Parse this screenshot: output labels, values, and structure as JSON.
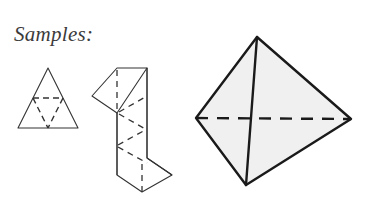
{
  "caption": {
    "text": "Samples:",
    "color": "#3b3b3b"
  },
  "canvas": {
    "width": 372,
    "height": 198,
    "background": "#ffffff"
  },
  "style": {
    "stroke_color": "#333333",
    "solid_stroke_width": 1.1,
    "heavy_stroke_width": 2.2,
    "dashed_stroke_width": 1.3,
    "dash_pattern_small": "5,4",
    "dash_pattern_large": "11,8",
    "solid_fill": "#f0f0f0"
  },
  "figures": [
    {
      "id": "triangle-net",
      "name": "triangular net with midpoint fold lines",
      "fill": "none",
      "outline": [
        [
          18,
          128
        ],
        [
          48,
          68
        ],
        [
          78,
          128
        ]
      ],
      "fold_lines": [
        [
          [
            33,
            98
          ],
          [
            63,
            98
          ]
        ],
        [
          [
            33,
            98
          ],
          [
            48,
            128
          ]
        ],
        [
          [
            63,
            98
          ],
          [
            48,
            128
          ]
        ]
      ]
    },
    {
      "id": "strip-net",
      "name": "zigzag parallelogram strip net",
      "fill": "none",
      "outline": [
        [
          117,
          68
        ],
        [
          142,
          85
        ],
        [
          142,
          175
        ],
        [
          172,
          175
        ],
        [
          147,
          158
        ],
        [
          147,
          68
        ],
        [
          92,
          96
        ],
        [
          117,
          113
        ],
        [
          117,
          68
        ]
      ],
      "vertical_edges": [
        [
          [
            117,
            68
          ],
          [
            117,
            113
          ]
        ],
        [
          [
            147,
            68
          ],
          [
            147,
            158
          ]
        ],
        [
          [
            117,
            113
          ],
          [
            117,
            175
          ]
        ]
      ],
      "fold_lines": [
        [
          [
            117,
            68
          ],
          [
            117,
            113
          ]
        ],
        [
          [
            117,
            113
          ],
          [
            147,
            96
          ]
        ],
        [
          [
            117,
            113
          ],
          [
            147,
            130
          ]
        ],
        [
          [
            117,
            140
          ],
          [
            147,
            130
          ]
        ],
        [
          [
            117,
            140
          ],
          [
            147,
            158
          ]
        ],
        [
          [
            142,
            175
          ],
          [
            142,
            158
          ]
        ]
      ]
    },
    {
      "id": "tetrahedron",
      "name": "shaded tetrahedron solid",
      "fill": "#f0f0f0",
      "vertices": {
        "apex": [
          257,
          37
        ],
        "left": [
          196,
          118
        ],
        "right": [
          351,
          119
        ],
        "bottom": [
          246,
          185
        ]
      },
      "solid_edges": [
        [
          [
            257,
            37
          ],
          [
            196,
            118
          ]
        ],
        [
          [
            257,
            37
          ],
          [
            351,
            119
          ]
        ],
        [
          [
            196,
            118
          ],
          [
            246,
            185
          ]
        ],
        [
          [
            351,
            119
          ],
          [
            246,
            185
          ]
        ],
        [
          [
            257,
            37
          ],
          [
            246,
            185
          ]
        ]
      ],
      "hidden_edges": [
        [
          [
            196,
            118
          ],
          [
            351,
            119
          ]
        ]
      ]
    }
  ]
}
